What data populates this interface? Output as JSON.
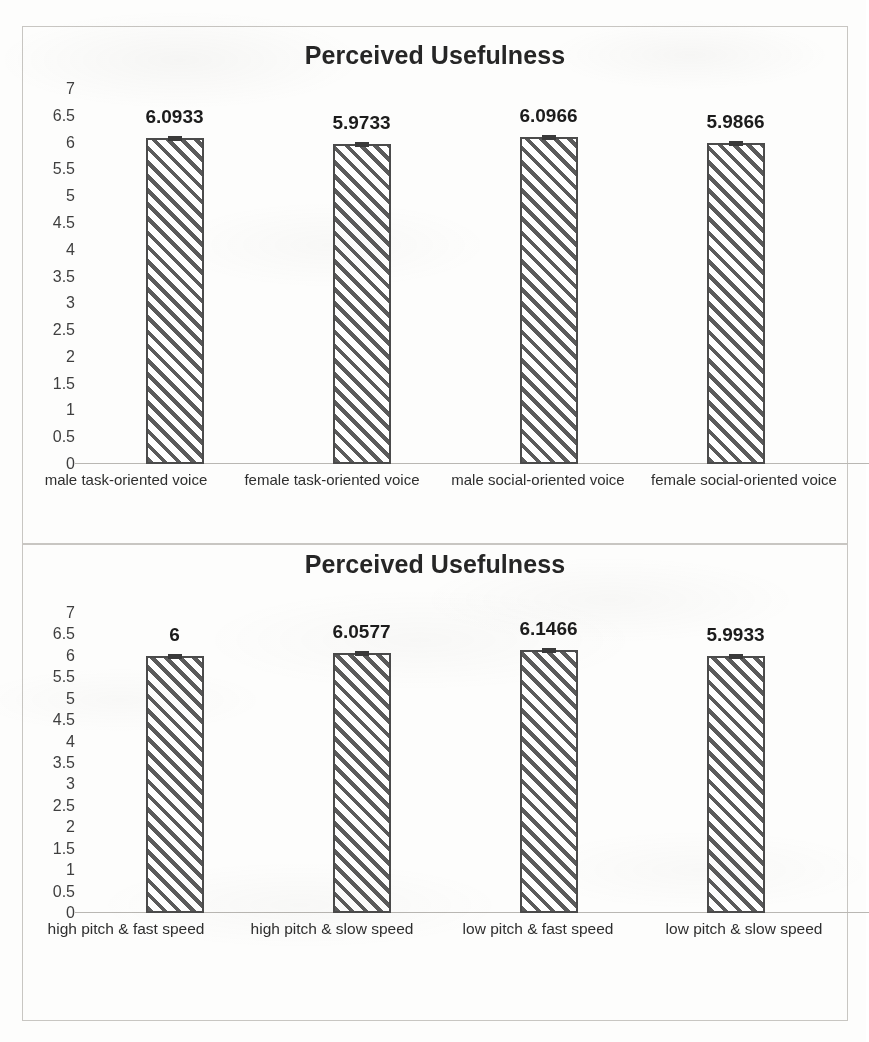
{
  "page": {
    "background_color": "#fdfdfc",
    "frame_color": "#c8c6c2",
    "bar_hatch_color": "#5b5b5b",
    "bar_border_color": "#4b4b4b",
    "axis_text_color": "#3f3f3f"
  },
  "charts": [
    {
      "id": "chart-voice-style",
      "title": "Perceived Usefulness",
      "yticks": [
        "7",
        "6.5",
        "6",
        "5.5",
        "5",
        "4.5",
        "4",
        "3.5",
        "3",
        "2.5",
        "2",
        "1.5",
        "1",
        "0.5",
        "0"
      ],
      "categories": [
        "male task-oriented voice",
        "female task-oriented voice",
        "male social-oriented voice",
        "female social-oriented voice"
      ],
      "value_labels": [
        "6.0933",
        "5.9733",
        "6.0966",
        "5.9866"
      ]
    },
    {
      "id": "chart-pitch-speed",
      "title": "Perceived Usefulness",
      "yticks": [
        "7",
        "6.5",
        "6",
        "5.5",
        "5",
        "4.5",
        "4",
        "3.5",
        "3",
        "2.5",
        "2",
        "1.5",
        "1",
        "0.5",
        "0"
      ],
      "categories": [
        "high pitch & fast speed",
        "high pitch & slow speed",
        "low pitch & fast speed",
        "low pitch & slow speed"
      ],
      "value_labels": [
        "6",
        "6.0577",
        "6.1466",
        "5.9933"
      ]
    }
  ],
  "chart_data": [
    {
      "type": "bar",
      "title": "Perceived Usefulness",
      "xlabel": "",
      "ylabel": "",
      "ylim": [
        0,
        7
      ],
      "ytick_step": 0.5,
      "grid": false,
      "legend": "none",
      "error_bars": true,
      "categories": [
        "male task-oriented voice",
        "female task-oriented voice",
        "male social-oriented voice",
        "female social-oriented voice"
      ],
      "values": [
        6.0933,
        5.9733,
        6.0966,
        5.9866
      ],
      "data_labels": [
        "6.0933",
        "5.9733",
        "6.0966",
        "5.9866"
      ]
    },
    {
      "type": "bar",
      "title": "Perceived Usefulness",
      "xlabel": "",
      "ylabel": "",
      "ylim": [
        0,
        7
      ],
      "ytick_step": 0.5,
      "grid": false,
      "legend": "none",
      "error_bars": true,
      "categories": [
        "high pitch & fast speed",
        "high pitch & slow speed",
        "low pitch & fast speed",
        "low pitch & slow speed"
      ],
      "values": [
        6,
        6.0577,
        6.1466,
        5.9933
      ],
      "data_labels": [
        "6",
        "6.0577",
        "6.1466",
        "5.9933"
      ]
    }
  ]
}
